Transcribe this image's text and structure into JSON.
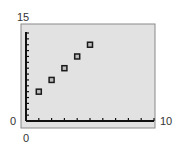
{
  "chart_data": {
    "type": "scatter",
    "title": "",
    "xlabel": "",
    "ylabel": "",
    "xlim": [
      0,
      10
    ],
    "ylim": [
      0,
      15
    ],
    "x_tick_step": 1,
    "y_tick_step": 1,
    "window_labels": {
      "ymax": "15",
      "xmin": "0",
      "xmax": "10",
      "ymin": "0"
    },
    "grid": false,
    "legend": "none",
    "marker": "hollow-square",
    "series": [
      {
        "name": "data",
        "points": [
          {
            "x": 1,
            "y": 5
          },
          {
            "x": 2,
            "y": 7
          },
          {
            "x": 3,
            "y": 9
          },
          {
            "x": 4,
            "y": 11
          },
          {
            "x": 5,
            "y": 13
          }
        ]
      }
    ]
  },
  "colors": {
    "screen_bg": "#e2e2e2",
    "frame": "#8a8a8a",
    "axis": "#111111",
    "marker": "#1a1a1a"
  }
}
